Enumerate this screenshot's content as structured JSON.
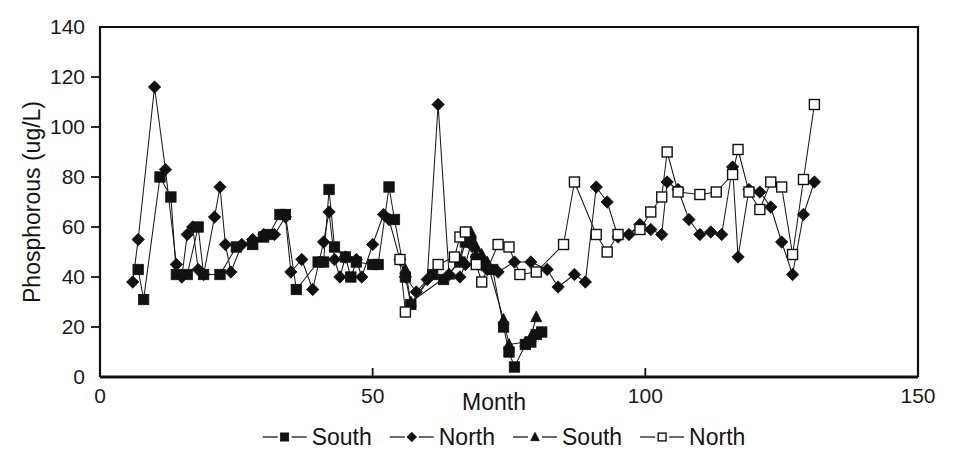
{
  "chart_data": {
    "type": "line",
    "title": "",
    "xlabel": "Month",
    "ylabel": "Phosphorous (ug/L)",
    "xlim": [
      0,
      150
    ],
    "ylim": [
      0,
      140
    ],
    "xticks": [
      0,
      50,
      100,
      150
    ],
    "yticks": [
      0,
      20,
      40,
      60,
      80,
      100,
      120,
      140
    ],
    "grid": false,
    "legend_position": "below-axis",
    "marker_legend": [
      {
        "label": "South",
        "marker": "filled-square"
      },
      {
        "label": "North",
        "marker": "filled-diamond"
      },
      {
        "label": "South",
        "marker": "filled-triangle"
      },
      {
        "label": "North",
        "marker": "open-square"
      }
    ],
    "series": [
      {
        "name": "South",
        "marker": "filled-square",
        "points": [
          [
            7,
            43
          ],
          [
            8,
            31
          ],
          [
            11,
            80
          ],
          [
            13,
            72
          ],
          [
            14,
            41
          ],
          [
            16,
            41
          ],
          [
            18,
            60
          ],
          [
            19,
            41
          ],
          [
            22,
            41
          ],
          [
            25,
            52
          ],
          [
            28,
            53
          ],
          [
            30,
            56
          ],
          [
            31,
            57
          ],
          [
            33,
            65
          ],
          [
            34,
            65
          ],
          [
            36,
            35
          ],
          [
            40,
            46
          ],
          [
            41,
            46
          ],
          [
            42,
            75
          ],
          [
            43,
            52
          ],
          [
            45,
            48
          ],
          [
            46,
            40
          ],
          [
            47,
            46
          ],
          [
            50,
            45
          ],
          [
            51,
            45
          ],
          [
            53,
            76
          ],
          [
            54,
            63
          ],
          [
            56,
            40
          ],
          [
            57,
            29
          ],
          [
            61,
            41
          ],
          [
            63,
            39
          ],
          [
            66,
            46
          ],
          [
            67,
            54
          ],
          [
            68,
            54
          ],
          [
            69,
            47
          ],
          [
            70,
            45
          ],
          [
            72,
            43
          ],
          [
            74,
            20
          ],
          [
            75,
            10
          ],
          [
            76,
            4
          ],
          [
            78,
            13
          ],
          [
            79,
            14
          ],
          [
            80,
            17
          ],
          [
            81,
            18
          ]
        ]
      },
      {
        "name": "North",
        "marker": "filled-diamond",
        "points": [
          [
            6,
            38
          ],
          [
            7,
            55
          ],
          [
            10,
            116
          ],
          [
            12,
            83
          ],
          [
            14,
            45
          ],
          [
            15,
            40
          ],
          [
            16,
            57
          ],
          [
            17,
            60
          ],
          [
            18,
            43
          ],
          [
            19,
            41
          ],
          [
            21,
            64
          ],
          [
            22,
            76
          ],
          [
            23,
            53
          ],
          [
            24,
            42
          ],
          [
            26,
            53
          ],
          [
            28,
            55
          ],
          [
            30,
            57
          ],
          [
            32,
            57
          ],
          [
            34,
            64
          ],
          [
            35,
            42
          ],
          [
            37,
            47
          ],
          [
            39,
            35
          ],
          [
            41,
            54
          ],
          [
            42,
            66
          ],
          [
            43,
            47
          ],
          [
            44,
            40
          ],
          [
            45,
            48
          ],
          [
            47,
            47
          ],
          [
            48,
            40
          ],
          [
            50,
            53
          ],
          [
            52,
            65
          ],
          [
            53,
            63
          ],
          [
            55,
            47
          ],
          [
            56,
            40
          ],
          [
            58,
            34
          ],
          [
            60,
            39
          ],
          [
            62,
            109
          ],
          [
            64,
            41
          ],
          [
            66,
            40
          ],
          [
            67,
            45
          ],
          [
            68,
            53
          ],
          [
            69,
            48
          ],
          [
            70,
            45
          ],
          [
            71,
            43
          ],
          [
            73,
            42
          ],
          [
            76,
            46
          ],
          [
            79,
            46
          ],
          [
            82,
            43
          ],
          [
            84,
            36
          ],
          [
            87,
            41
          ],
          [
            89,
            38
          ],
          [
            91,
            76
          ],
          [
            93,
            70
          ],
          [
            95,
            56
          ],
          [
            97,
            57
          ],
          [
            99,
            61
          ],
          [
            101,
            59
          ],
          [
            103,
            57
          ],
          [
            104,
            78
          ],
          [
            106,
            75
          ],
          [
            108,
            63
          ],
          [
            110,
            57
          ],
          [
            112,
            58
          ],
          [
            114,
            57
          ],
          [
            116,
            84
          ],
          [
            117,
            48
          ],
          [
            119,
            75
          ],
          [
            121,
            74
          ],
          [
            123,
            68
          ],
          [
            125,
            54
          ],
          [
            127,
            41
          ],
          [
            129,
            65
          ],
          [
            131,
            78
          ]
        ]
      },
      {
        "name": "South",
        "marker": "filled-triangle",
        "points": [
          [
            56,
            43
          ],
          [
            57,
            30
          ],
          [
            64,
            41
          ],
          [
            66,
            47
          ],
          [
            67,
            58
          ],
          [
            68,
            58
          ],
          [
            69,
            52
          ],
          [
            70,
            49
          ],
          [
            71,
            46
          ],
          [
            74,
            23
          ],
          [
            75,
            13
          ],
          [
            78,
            14
          ],
          [
            79,
            16
          ],
          [
            80,
            24
          ]
        ]
      },
      {
        "name": "North",
        "marker": "open-square",
        "points": [
          [
            55,
            47
          ],
          [
            56,
            26
          ],
          [
            62,
            45
          ],
          [
            65,
            48
          ],
          [
            66,
            56
          ],
          [
            67,
            58
          ],
          [
            69,
            45
          ],
          [
            70,
            38
          ],
          [
            73,
            53
          ],
          [
            75,
            52
          ],
          [
            77,
            41
          ],
          [
            80,
            42
          ],
          [
            85,
            53
          ],
          [
            87,
            78
          ],
          [
            91,
            57
          ],
          [
            93,
            50
          ],
          [
            95,
            57
          ],
          [
            99,
            59
          ],
          [
            101,
            66
          ],
          [
            103,
            72
          ],
          [
            104,
            90
          ],
          [
            106,
            74
          ],
          [
            110,
            73
          ],
          [
            113,
            74
          ],
          [
            116,
            81
          ],
          [
            117,
            91
          ],
          [
            119,
            74
          ],
          [
            121,
            67
          ],
          [
            123,
            78
          ],
          [
            125,
            76
          ],
          [
            127,
            49
          ],
          [
            129,
            79
          ],
          [
            131,
            109
          ]
        ]
      }
    ]
  }
}
